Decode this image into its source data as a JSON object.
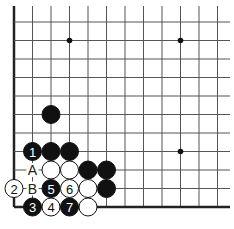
{
  "diagram": {
    "type": "go-board-corner",
    "corner": "bottom-left",
    "grid": {
      "origin_x": 14,
      "origin_y": 207,
      "spacing_x": 18.5,
      "spacing_y": 18.5,
      "cols": 12,
      "rows": 11,
      "line_color": "#555555",
      "edge_color": "#222222"
    },
    "hoshi": [
      {
        "col": 3,
        "row": 9
      },
      {
        "col": 9,
        "row": 9
      },
      {
        "col": 9,
        "row": 3
      }
    ],
    "stones": [
      {
        "color": "black",
        "col": 2,
        "row": 5,
        "label": ""
      },
      {
        "color": "black",
        "col": 1,
        "row": 3,
        "label": "1"
      },
      {
        "color": "black",
        "col": 2,
        "row": 3,
        "label": ""
      },
      {
        "color": "black",
        "col": 3,
        "row": 3,
        "label": ""
      },
      {
        "color": "white",
        "col": 2,
        "row": 2,
        "label": ""
      },
      {
        "color": "white",
        "col": 3,
        "row": 2,
        "label": ""
      },
      {
        "color": "black",
        "col": 4,
        "row": 2,
        "label": ""
      },
      {
        "color": "black",
        "col": 5,
        "row": 2,
        "label": ""
      },
      {
        "color": "white",
        "col": 0,
        "row": 1,
        "label": "2"
      },
      {
        "color": "black",
        "col": 2,
        "row": 1,
        "label": "5"
      },
      {
        "color": "white",
        "col": 3,
        "row": 1,
        "label": "6"
      },
      {
        "color": "white",
        "col": 4,
        "row": 1,
        "label": ""
      },
      {
        "color": "black",
        "col": 5,
        "row": 1,
        "label": ""
      },
      {
        "color": "black",
        "col": 1,
        "row": 0,
        "label": "3"
      },
      {
        "color": "white",
        "col": 2,
        "row": 0,
        "label": "4"
      },
      {
        "color": "black",
        "col": 3,
        "row": 0,
        "label": "7"
      },
      {
        "color": "white",
        "col": 4,
        "row": 0,
        "label": ""
      }
    ],
    "letters": [
      {
        "text": "A",
        "col": 1,
        "row": 2
      },
      {
        "text": "B",
        "col": 1,
        "row": 1
      }
    ]
  }
}
